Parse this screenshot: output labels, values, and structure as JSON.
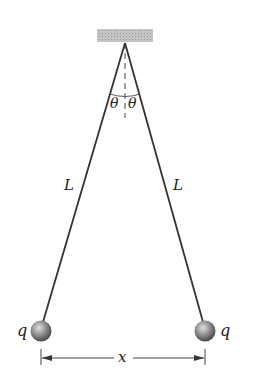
{
  "diagram": {
    "labels": {
      "theta_left": "θ",
      "theta_right": "θ",
      "length_left": "L",
      "length_right": "L",
      "charge_left": "q",
      "charge_right": "q",
      "separation": "x"
    },
    "colors": {
      "ceiling": "#b8b8b8",
      "string": "#333333",
      "sphere": "#8a8a8a",
      "text": "#222222"
    }
  }
}
